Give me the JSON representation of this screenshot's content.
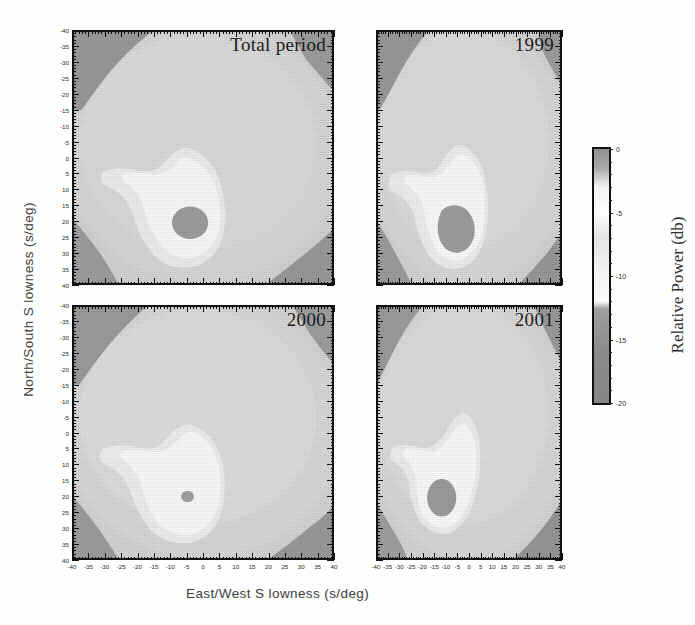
{
  "figure": {
    "xlabel": "East/West S lowness (s/deg)",
    "ylabel": "North/South S lowness (s/deg)",
    "colorbar_title": "Relative Power (db)"
  },
  "chart_data": {
    "type": "heatmap",
    "title": "",
    "xlabel": "East/West S lowness (s/deg)",
    "ylabel": "North/South S lowness (s/deg)",
    "zlabel": "Relative Power (db)",
    "xlim": [
      -40,
      40
    ],
    "ylim": [
      -40,
      40
    ],
    "zlim": [
      -20,
      0
    ],
    "xticks": [
      -40,
      -35,
      -30,
      -25,
      -20,
      -15,
      -10,
      -5,
      0,
      5,
      10,
      15,
      20,
      25,
      30,
      35,
      40
    ],
    "yticks": [
      -40,
      -35,
      -30,
      -25,
      -20,
      -15,
      -10,
      -5,
      0,
      5,
      10,
      15,
      20,
      25,
      30,
      35,
      40
    ],
    "zticks": [
      0,
      -5,
      -10,
      -15,
      -20
    ],
    "grid": false,
    "legend_position": "right",
    "colormap": "grayscale-banded",
    "colormap_stops": [
      {
        "value": 0,
        "color": "#8f8f8f"
      },
      {
        "value": -1.5,
        "color": "#a8a8a8"
      },
      {
        "value": -3,
        "color": "#f2f2f2"
      },
      {
        "value": -5,
        "color": "#fdfdfd"
      },
      {
        "value": -7,
        "color": "#e3e3e3"
      },
      {
        "value": -10,
        "color": "#f4f4f4"
      },
      {
        "value": -12,
        "color": "#fafafa"
      },
      {
        "value": -12.6,
        "color": "#9e9e9e"
      },
      {
        "value": -16,
        "color": "#8b8b8b"
      },
      {
        "value": -20,
        "color": "#858585"
      }
    ],
    "panels": [
      {
        "id": "total-period",
        "label": "Total period",
        "peak": {
          "x": -4,
          "y": -25,
          "power_db": 0
        },
        "description": "Broad high-power lobe centered near (-4,-25) with an elongated ridge extending north to y=-5 and a western arm near (-28,-12); dark low-power corners at upper-left, upper-right and lower-left/lower-right.",
        "core": {
          "cx": -4,
          "cy": -25,
          "rx": 5.5,
          "ry": 5.0,
          "shape": "ellipse"
        }
      },
      {
        "id": "1999",
        "label": "1999",
        "peak": {
          "x": -8,
          "y": -26,
          "power_db": 0
        },
        "description": "Ring-shaped high-power annulus around a large saturated core near (-8,-26); ridge extends north to y=-8 with a western arm near (-32,-17).",
        "core": {
          "cx": -8,
          "cy": -26,
          "rx": 7.5,
          "ry": 6.5,
          "shape": "rounded-wedge"
        }
      },
      {
        "id": "2000",
        "label": "2000",
        "peak": {
          "x": -5,
          "y": -25,
          "power_db": 0
        },
        "description": "Compact high-power lobe centered near (-5,-28) with a narrow ridge reaching y=-3; very small dark core dot at (-5,-25).",
        "core": {
          "cx": -5,
          "cy": -25,
          "rx": 1.8,
          "ry": 1.7,
          "shape": "ellipse"
        }
      },
      {
        "id": "2001",
        "label": "2001",
        "peak": {
          "x": -12,
          "y": -27,
          "power_db": 0
        },
        "description": "High-power lobe centered near (-12,-27) with a prominent ridge rising north-east to y=-7; round dark core at (-12,-27).",
        "core": {
          "cx": -12,
          "cy": -27,
          "rx": 6.0,
          "ry": 5.5,
          "shape": "ellipse"
        }
      }
    ]
  },
  "axes": {
    "xticklabels": [
      "-40",
      "-35",
      "-30",
      "-25",
      "-20",
      "-15",
      "-10",
      "-5",
      "0",
      "5",
      "10",
      "15",
      "20",
      "25",
      "30",
      "35",
      "40"
    ],
    "yticklabels": [
      "40",
      "35",
      "30",
      "25",
      "20",
      "15",
      "10",
      "5",
      "0",
      "-5",
      "-10",
      "-15",
      "-20",
      "-25",
      "-30",
      "-35",
      "-40"
    ]
  },
  "colorbar": {
    "labels": [
      "0",
      "-5",
      "-10",
      "-15",
      "-20"
    ]
  }
}
